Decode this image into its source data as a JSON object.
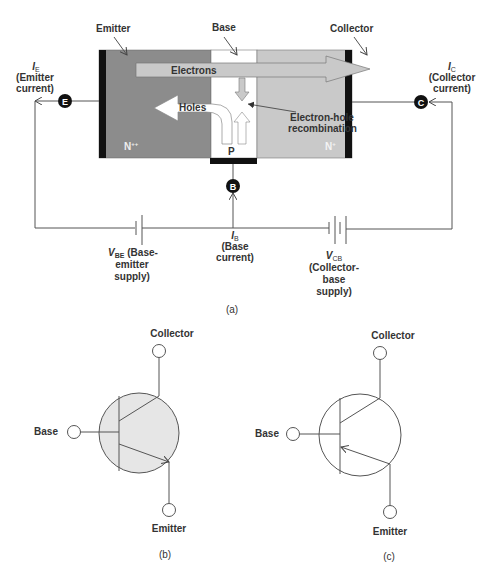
{
  "diagram_a": {
    "caption": "(a)",
    "regions": {
      "emitter": {
        "label": "Emitter",
        "doping": "N++",
        "doping_base": "N",
        "doping_sup": "++",
        "color": "#8c8c8c"
      },
      "base": {
        "label": "Base",
        "doping": "P",
        "color": "#ffffff"
      },
      "collector": {
        "label": "Collector",
        "doping": "N+",
        "doping_base": "N",
        "doping_sup": "+",
        "color": "#c9c9c9"
      }
    },
    "flows": {
      "electrons": "Electrons",
      "holes": "Holes",
      "recombination_line1": "Electron-hole",
      "recombination_line2": "recombination"
    },
    "terminals": {
      "emitter": "E",
      "base": "B",
      "collector": "C"
    },
    "currents": {
      "emitter": {
        "symbol": "I",
        "sub": "E",
        "line1": "(Emitter",
        "line2": "current)"
      },
      "collector": {
        "symbol": "I",
        "sub": "C",
        "line1": "(Collector",
        "line2": "current)"
      },
      "base": {
        "symbol": "I",
        "sub": "B",
        "line1": "(Base",
        "line2": "current)"
      }
    },
    "supplies": {
      "vbe": {
        "symbol": "V",
        "sub": "BE",
        "line1": " (Base-",
        "line2": "emitter",
        "line3": "supply)"
      },
      "vcb": {
        "symbol": "V",
        "sub": "CB",
        "line1": "(Collector-",
        "line2": "base",
        "line3": "supply)"
      }
    }
  },
  "diagram_b": {
    "caption": "(b)",
    "type": "NPN transistor symbol",
    "fill": "#e6e6e6",
    "labels": {
      "collector": "Collector",
      "base": "Base",
      "emitter": "Emitter"
    }
  },
  "diagram_c": {
    "caption": "(c)",
    "type": "PNP transistor symbol",
    "fill": "#ffffff",
    "labels": {
      "collector": "Collector",
      "base": "Base",
      "emitter": "Emitter"
    }
  }
}
